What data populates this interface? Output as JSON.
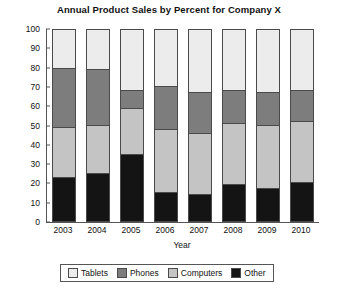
{
  "chart_data": {
    "type": "bar",
    "subtype": "stacked-percent",
    "title": "Annual Product Sales by Percent for Company X",
    "xlabel": "Year",
    "ylabel": "Revenue",
    "categories": [
      "2003",
      "2004",
      "2005",
      "2006",
      "2007",
      "2008",
      "2009",
      "2010"
    ],
    "ylim": [
      0,
      100
    ],
    "yticks": [
      0,
      10,
      20,
      30,
      40,
      50,
      60,
      70,
      80,
      90,
      100
    ],
    "grid": false,
    "legend_position": "bottom",
    "stack_order_bottom_to_top": [
      "Other",
      "Computers",
      "Phones",
      "Tablets"
    ],
    "series": [
      {
        "name": "Other",
        "color": "#141414",
        "values": [
          23,
          25,
          35,
          15,
          14,
          19,
          17,
          20
        ]
      },
      {
        "name": "Computers",
        "color": "#c4c4c4",
        "values": [
          26,
          25,
          24,
          33,
          32,
          32,
          33,
          32
        ]
      },
      {
        "name": "Phones",
        "color": "#7d7d7d",
        "values": [
          31,
          29,
          9,
          22,
          21,
          17,
          17,
          16
        ]
      },
      {
        "name": "Tablets",
        "color": "#ececec",
        "values": [
          20,
          21,
          32,
          30,
          33,
          32,
          33,
          32
        ]
      }
    ],
    "cumulative_tops": {
      "other": [
        23,
        25,
        35,
        15,
        14,
        19,
        17,
        20
      ],
      "computers": [
        49,
        50,
        59,
        48,
        46,
        51,
        50,
        52
      ],
      "phones": [
        80,
        79,
        68,
        70,
        67,
        68,
        67,
        68
      ],
      "tablets": [
        100,
        100,
        100,
        100,
        100,
        100,
        100,
        100
      ]
    }
  },
  "legend": {
    "items": [
      {
        "label": "Tablets",
        "swatch": "tablets"
      },
      {
        "label": "Phones",
        "swatch": "phones"
      },
      {
        "label": "Computers",
        "swatch": "computers"
      },
      {
        "label": "Other",
        "swatch": "other"
      }
    ]
  },
  "colors": {
    "tablets": "#ececec",
    "phones": "#7d7d7d",
    "computers": "#c4c4c4",
    "other": "#141414",
    "axis": "#555555",
    "text": "#111111",
    "background": "#ffffff"
  }
}
